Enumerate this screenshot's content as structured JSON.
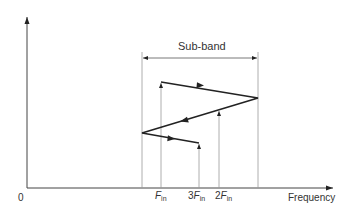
{
  "diagram": {
    "subband_label": "Sub-band",
    "axis_origin_label": "0",
    "x_axis_label": "Frequency",
    "ticks": [
      {
        "coef": "",
        "var": "F",
        "sub": "in"
      },
      {
        "coef": "3",
        "var": "F",
        "sub": "in"
      },
      {
        "coef": "2",
        "var": "F",
        "sub": "in"
      }
    ],
    "colors": {
      "line": "#333333",
      "thin": "#888888"
    }
  }
}
